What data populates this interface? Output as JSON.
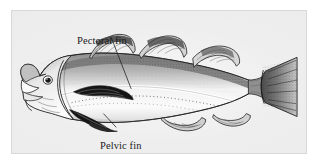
{
  "figure": {
    "medium": "pen-and-ink stipple illustration",
    "frame_color": "#d8d8da",
    "plate_color": "#ececed",
    "ink_color": "#1a1a1a",
    "label_color": "#1a1a1a"
  },
  "annotations": [
    {
      "id": "pectoral",
      "label": "Pectoral fin",
      "leader_from": {
        "x": 110,
        "y": 36
      },
      "leader_to": {
        "x": 131,
        "y": 88
      }
    },
    {
      "id": "pelvic",
      "label": "Pelvic fin",
      "leader_from": {
        "x": 115,
        "y": 127
      },
      "leader_to": {
        "x": 104,
        "y": 114
      }
    }
  ],
  "anatomy": {
    "dorsal_fin_count": 3,
    "anal_fin_count": 2,
    "caudal_fin_shape": "truncate",
    "barbel": "single chin barbel",
    "lateral_line": "pale curved stripe along flank"
  }
}
